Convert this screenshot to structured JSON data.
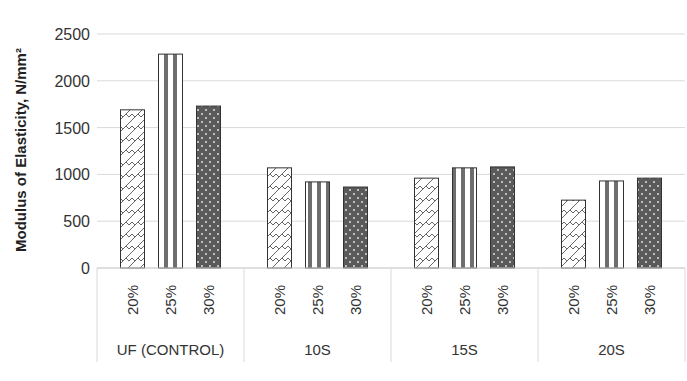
{
  "chart_data": {
    "type": "bar",
    "title": "",
    "xlabel": "",
    "ylabel": "Modulus of Elasticity, N/mm²",
    "ylim": [
      0,
      2500
    ],
    "yticks": [
      0,
      500,
      1000,
      1500,
      2000,
      2500
    ],
    "grid": true,
    "legend": "none",
    "groups": [
      {
        "label": "UF (CONTROL)",
        "categories": [
          "20%",
          "25%",
          "30%"
        ],
        "values": [
          1690,
          2285,
          1730
        ]
      },
      {
        "label": "10S",
        "categories": [
          "20%",
          "25%",
          "30%"
        ],
        "values": [
          1070,
          920,
          865
        ]
      },
      {
        "label": "15S",
        "categories": [
          "20%",
          "25%",
          "30%"
        ],
        "values": [
          960,
          1070,
          1080
        ]
      },
      {
        "label": "20S",
        "categories": [
          "20%",
          "25%",
          "30%"
        ],
        "values": [
          725,
          930,
          960
        ]
      }
    ],
    "bar_patterns": {
      "20%": "diagonal-wave-hatch",
      "25%": "vertical-stripes",
      "30%": "dark-dotted"
    }
  },
  "axis": {
    "ylabel": "Modulus of Elasticity, N/mm²"
  }
}
